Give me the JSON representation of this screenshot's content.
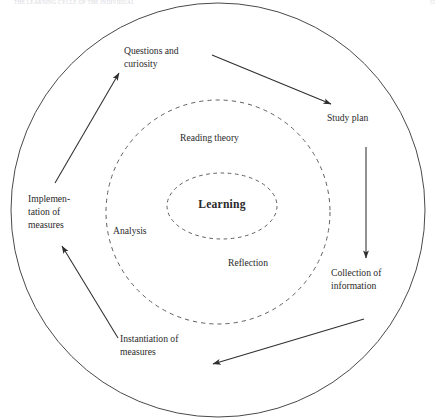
{
  "page": {
    "running_head": "THE LEARNING CYCLE OF THE INDIVIDUAL",
    "folio": "35"
  },
  "diagram": {
    "title": "Learning cycle",
    "center": {
      "label": "Learning"
    },
    "inner_ring_labels": [
      {
        "id": "reading-theory",
        "label": "Reading theory"
      },
      {
        "id": "analysis",
        "label": "Analysis"
      },
      {
        "id": "reflection",
        "label": "Reflection"
      }
    ],
    "outer_ring_labels": [
      {
        "id": "questions-and-curiosity",
        "label": "Questions and\ncuriosity"
      },
      {
        "id": "study-plan",
        "label": "Study plan"
      },
      {
        "id": "collection-of-information",
        "label": "Collection of\ninformation"
      },
      {
        "id": "instantiation-of-measures",
        "label": "Instantiation of\nmeasures"
      },
      {
        "id": "implementation-of-measures",
        "label": "Implemen-\ntation of\nmeasures"
      }
    ],
    "arrows": [
      {
        "id": "arrow-questions-to-study-plan",
        "from": "questions-and-curiosity",
        "to": "study-plan"
      },
      {
        "id": "arrow-study-plan-to-collection",
        "from": "study-plan",
        "to": "collection-of-information"
      },
      {
        "id": "arrow-collection-to-instantiation",
        "from": "collection-of-information",
        "to": "instantiation-of-measures"
      },
      {
        "id": "arrow-instantiation-to-implementation",
        "from": "instantiation-of-measures",
        "to": "implementation-of-measures"
      },
      {
        "id": "arrow-implementation-to-questions",
        "from": "implementation-of-measures",
        "to": "questions-and-curiosity"
      }
    ],
    "rings": [
      {
        "id": "outer-circle",
        "style": "solid",
        "cx": 218,
        "cy": 210,
        "r": 207
      },
      {
        "id": "middle-circle",
        "style": "dashed",
        "cx": 218,
        "cy": 212,
        "r": 112
      },
      {
        "id": "inner-ellipse",
        "style": "dashed",
        "cx": 222,
        "cy": 206,
        "rx": 55,
        "ry": 33
      }
    ],
    "colors": {
      "stroke": "#4a4a4a",
      "dashed_stroke": "#6b6b6b",
      "text": "#2a2a2a",
      "background": "#ffffff"
    }
  }
}
